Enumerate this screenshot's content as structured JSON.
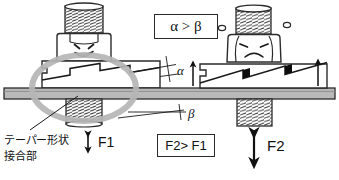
{
  "diagram": {
    "title_context": "taper-joint bolt fastening comparison",
    "background": "#ffffff",
    "ink": "#1a1a1a",
    "plate_fill": "#b9b9b9",
    "block_fill": "#ffffff",
    "highlight_ellipse_color": "#b5b5b5",
    "step_fill": "#0d0d0d"
  },
  "boxes": {
    "angle_relation": "α > β",
    "force_relation": "F2> F1"
  },
  "angles": {
    "alpha": "α",
    "beta": "β"
  },
  "forces": {
    "f1": "F1",
    "f2": "F2"
  },
  "callout": {
    "line1": "テーパー形状",
    "line2": "接合部"
  },
  "left_assembly": {
    "name": "happy-bolt-assembly",
    "face_mood": "smiling",
    "joint_style": "shallow-taper-zigzag",
    "bolt_label": "left-bolt-thread"
  },
  "right_assembly": {
    "name": "sad-bolt-assembly",
    "face_mood": "frowning",
    "joint_style": "steep-taper-zigzag-filled",
    "bolt_label": "right-bolt-thread"
  }
}
